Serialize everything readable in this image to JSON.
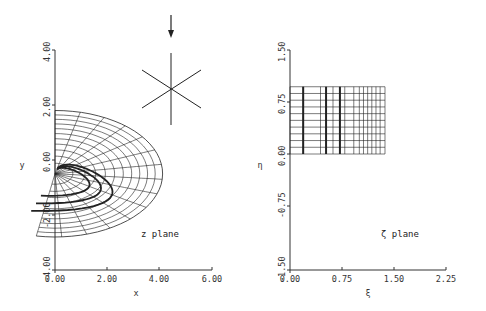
{
  "chart_data": [
    {
      "type": "line",
      "name": "z-plane",
      "title": "z plane",
      "xlabel": "x",
      "ylabel": "y",
      "xlim": [
        0,
        6
      ],
      "ylim": [
        -4,
        4
      ],
      "xticks": [
        "0.00",
        "2.00",
        "4.00",
        "6.00"
      ],
      "yticks": [
        "-4.00",
        "-2.00",
        "0.00",
        "2.00",
        "4.00"
      ],
      "grid": false,
      "description": "Conformal image of rectangular zeta-plane grid: fan-shaped curvilinear mesh emanating from near origin, outer boundary arc from (0,1.8) to (4.2,-1.3) to (0.9,-2.6); three highlighted bold coordinate curves",
      "mesh": {
        "center": [
          0.0,
          -0.5
        ],
        "radial_lines": 14,
        "arcs": 11,
        "angle_start_deg": 90,
        "angle_end_deg": -100,
        "max_radius": 2.3
      },
      "inset_symbol": {
        "type": "six-pointed star with downward arrow",
        "arrow_label": ""
      }
    },
    {
      "type": "line",
      "name": "zeta-plane",
      "title": "ζ plane",
      "xlabel": "ξ",
      "ylabel": "η",
      "xlim": [
        0,
        2.25
      ],
      "ylim": [
        -1.5,
        1.5
      ],
      "xticks": [
        "0.00",
        "0.75",
        "1.50",
        "2.25"
      ],
      "yticks": [
        "-1.50",
        "-0.75",
        "0.00",
        "0.75",
        "1.50"
      ],
      "grid": false,
      "rectangle": {
        "xi": [
          0.0,
          1.37
        ],
        "eta": [
          0.0,
          0.97
        ]
      },
      "horizontal_lines_eta": [
        0.0,
        0.097,
        0.194,
        0.291,
        0.388,
        0.485,
        0.582,
        0.679,
        0.776,
        0.873,
        0.97
      ],
      "vertical_lines_xi": [
        0.0,
        0.19,
        0.44,
        0.62,
        0.79,
        0.92,
        1.0,
        1.06,
        1.12,
        1.18,
        1.24,
        1.3,
        1.37
      ],
      "bold_vertical_lines_xi": [
        0.19,
        0.52,
        0.72
      ]
    }
  ],
  "left": {
    "ylabel": "y",
    "xlabel": "x",
    "plane_label": "z plane",
    "xticks": [
      "0.00",
      "2.00",
      "4.00",
      "6.00"
    ],
    "yticks": [
      "-4.00",
      "-2.00",
      "0.00",
      "2.00",
      "4.00"
    ]
  },
  "right": {
    "ylabel": "η",
    "xlabel": "ξ",
    "plane_label": "ζ plane",
    "xticks": [
      "0.00",
      "0.75",
      "1.50",
      "2.25"
    ],
    "yticks": [
      "-1.50",
      "-0.75",
      "0.00",
      "0.75",
      "1.50"
    ]
  },
  "colors": {
    "ink": "#222222",
    "background": "#ffffff"
  }
}
